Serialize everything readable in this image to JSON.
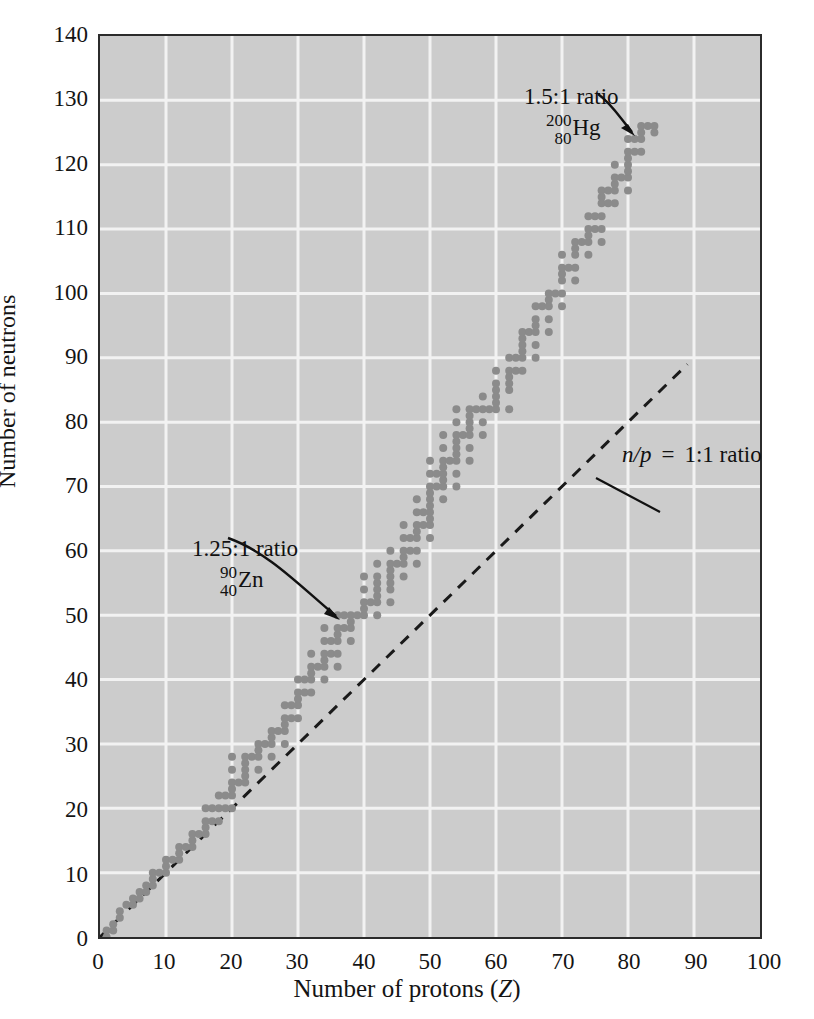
{
  "figure": {
    "kind": "band-of-stability-scatter"
  },
  "axes": {
    "x": {
      "title_main": "Number of protons (",
      "title_symbol": "Z",
      "title_close": ")",
      "ticks": [
        "0",
        "10",
        "20",
        "30",
        "40",
        "50",
        "60",
        "70",
        "80",
        "90",
        "100"
      ]
    },
    "y": {
      "title": "Number of neutrons",
      "ticks": [
        "0",
        "10",
        "20",
        "30",
        "40",
        "50",
        "60",
        "70",
        "80",
        "90",
        "100",
        "110",
        "120",
        "130",
        "140"
      ]
    }
  },
  "annotations": {
    "hg": {
      "ratio": "1.5:1 ratio",
      "mass_number": "200",
      "atomic_number": "80",
      "symbol": "Hg"
    },
    "zn": {
      "ratio": "1.25:1 ratio",
      "mass_number": "90",
      "atomic_number": "40",
      "symbol": "Zn"
    },
    "diagonal": {
      "n_symbol": "n",
      "slash": "/",
      "p_symbol": "p",
      "equals": "=",
      "ratio": "1:1 ratio"
    }
  },
  "colors": {
    "plot_background": "#cccccc",
    "gridline": "#f2f2f2",
    "frame": "#2b2b2b",
    "data_point": "#8b8b8b",
    "dashed_line": "#1a1a1a",
    "text": "#141414"
  },
  "chart_data": {
    "type": "scatter",
    "title": "",
    "xlabel": "Number of protons (Z)",
    "ylabel": "Number of neutrons",
    "xlim": [
      0,
      100
    ],
    "ylim": [
      0,
      140
    ],
    "xticks": [
      0,
      10,
      20,
      30,
      40,
      50,
      60,
      70,
      80,
      90,
      100
    ],
    "yticks": [
      0,
      10,
      20,
      30,
      40,
      50,
      60,
      70,
      80,
      90,
      100,
      110,
      120,
      130,
      140
    ],
    "grid": true,
    "legend": false,
    "marker": {
      "shape": "circle",
      "size_px": 8,
      "color": "#8b8b8b"
    },
    "reference_line": {
      "name": "n/p = 1:1 ratio",
      "style": "dashed",
      "x": [
        0,
        89
      ],
      "y": [
        0,
        89
      ]
    },
    "annotated_points": [
      {
        "label": "200/80 Hg",
        "x": 80,
        "y": 120,
        "ratio": "1.5:1"
      },
      {
        "label": "90/40 Zn",
        "x": 40,
        "y": 50,
        "ratio": "1.25:1"
      }
    ],
    "series": [
      {
        "name": "stable nuclides",
        "points": [
          [
            1,
            0
          ],
          [
            1,
            1
          ],
          [
            2,
            1
          ],
          [
            2,
            2
          ],
          [
            3,
            3
          ],
          [
            3,
            4
          ],
          [
            4,
            5
          ],
          [
            5,
            5
          ],
          [
            5,
            6
          ],
          [
            6,
            6
          ],
          [
            6,
            7
          ],
          [
            7,
            7
          ],
          [
            7,
            8
          ],
          [
            8,
            8
          ],
          [
            8,
            9
          ],
          [
            8,
            10
          ],
          [
            9,
            10
          ],
          [
            10,
            10
          ],
          [
            10,
            11
          ],
          [
            10,
            12
          ],
          [
            11,
            12
          ],
          [
            12,
            12
          ],
          [
            12,
            13
          ],
          [
            12,
            14
          ],
          [
            13,
            14
          ],
          [
            14,
            14
          ],
          [
            14,
            15
          ],
          [
            14,
            16
          ],
          [
            15,
            16
          ],
          [
            16,
            16
          ],
          [
            16,
            17
          ],
          [
            16,
            18
          ],
          [
            16,
            20
          ],
          [
            17,
            18
          ],
          [
            17,
            20
          ],
          [
            18,
            18
          ],
          [
            18,
            20
          ],
          [
            18,
            22
          ],
          [
            19,
            20
          ],
          [
            19,
            22
          ],
          [
            20,
            20
          ],
          [
            20,
            22
          ],
          [
            20,
            23
          ],
          [
            20,
            24
          ],
          [
            20,
            26
          ],
          [
            20,
            28
          ],
          [
            21,
            24
          ],
          [
            22,
            24
          ],
          [
            22,
            25
          ],
          [
            22,
            26
          ],
          [
            22,
            27
          ],
          [
            22,
            28
          ],
          [
            23,
            28
          ],
          [
            24,
            26
          ],
          [
            24,
            28
          ],
          [
            24,
            29
          ],
          [
            24,
            30
          ],
          [
            25,
            30
          ],
          [
            26,
            28
          ],
          [
            26,
            30
          ],
          [
            26,
            31
          ],
          [
            26,
            32
          ],
          [
            27,
            32
          ],
          [
            28,
            30
          ],
          [
            28,
            32
          ],
          [
            28,
            33
          ],
          [
            28,
            34
          ],
          [
            28,
            36
          ],
          [
            29,
            34
          ],
          [
            29,
            36
          ],
          [
            30,
            34
          ],
          [
            30,
            36
          ],
          [
            30,
            37
          ],
          [
            30,
            38
          ],
          [
            30,
            40
          ],
          [
            31,
            38
          ],
          [
            31,
            40
          ],
          [
            32,
            38
          ],
          [
            32,
            40
          ],
          [
            32,
            41
          ],
          [
            32,
            42
          ],
          [
            32,
            44
          ],
          [
            33,
            42
          ],
          [
            34,
            40
          ],
          [
            34,
            42
          ],
          [
            34,
            43
          ],
          [
            34,
            44
          ],
          [
            34,
            46
          ],
          [
            34,
            48
          ],
          [
            35,
            44
          ],
          [
            35,
            46
          ],
          [
            36,
            42
          ],
          [
            36,
            44
          ],
          [
            36,
            46
          ],
          [
            36,
            47
          ],
          [
            36,
            48
          ],
          [
            36,
            50
          ],
          [
            37,
            48
          ],
          [
            37,
            50
          ],
          [
            38,
            46
          ],
          [
            38,
            48
          ],
          [
            38,
            49
          ],
          [
            38,
            50
          ],
          [
            39,
            50
          ],
          [
            40,
            50
          ],
          [
            40,
            51
          ],
          [
            40,
            52
          ],
          [
            40,
            54
          ],
          [
            40,
            56
          ],
          [
            41,
            52
          ],
          [
            42,
            50
          ],
          [
            42,
            52
          ],
          [
            42,
            53
          ],
          [
            42,
            54
          ],
          [
            42,
            55
          ],
          [
            42,
            56
          ],
          [
            42,
            58
          ],
          [
            44,
            52
          ],
          [
            44,
            54
          ],
          [
            44,
            55
          ],
          [
            44,
            56
          ],
          [
            44,
            57
          ],
          [
            44,
            58
          ],
          [
            44,
            60
          ],
          [
            45,
            58
          ],
          [
            46,
            56
          ],
          [
            46,
            58
          ],
          [
            46,
            59
          ],
          [
            46,
            60
          ],
          [
            46,
            62
          ],
          [
            46,
            64
          ],
          [
            47,
            60
          ],
          [
            47,
            62
          ],
          [
            48,
            58
          ],
          [
            48,
            60
          ],
          [
            48,
            62
          ],
          [
            48,
            63
          ],
          [
            48,
            64
          ],
          [
            48,
            66
          ],
          [
            48,
            68
          ],
          [
            49,
            64
          ],
          [
            49,
            66
          ],
          [
            50,
            62
          ],
          [
            50,
            64
          ],
          [
            50,
            65
          ],
          [
            50,
            66
          ],
          [
            50,
            67
          ],
          [
            50,
            68
          ],
          [
            50,
            69
          ],
          [
            50,
            70
          ],
          [
            50,
            72
          ],
          [
            50,
            74
          ],
          [
            51,
            70
          ],
          [
            51,
            72
          ],
          [
            52,
            68
          ],
          [
            52,
            70
          ],
          [
            52,
            71
          ],
          [
            52,
            72
          ],
          [
            52,
            73
          ],
          [
            52,
            74
          ],
          [
            52,
            76
          ],
          [
            52,
            78
          ],
          [
            53,
            74
          ],
          [
            54,
            70
          ],
          [
            54,
            72
          ],
          [
            54,
            74
          ],
          [
            54,
            75
          ],
          [
            54,
            76
          ],
          [
            54,
            77
          ],
          [
            54,
            78
          ],
          [
            54,
            80
          ],
          [
            54,
            82
          ],
          [
            55,
            78
          ],
          [
            56,
            74
          ],
          [
            56,
            76
          ],
          [
            56,
            78
          ],
          [
            56,
            79
          ],
          [
            56,
            80
          ],
          [
            56,
            81
          ],
          [
            56,
            82
          ],
          [
            57,
            82
          ],
          [
            58,
            78
          ],
          [
            58,
            80
          ],
          [
            58,
            82
          ],
          [
            58,
            84
          ],
          [
            59,
            82
          ],
          [
            60,
            82
          ],
          [
            60,
            83
          ],
          [
            60,
            84
          ],
          [
            60,
            85
          ],
          [
            60,
            86
          ],
          [
            60,
            88
          ],
          [
            62,
            82
          ],
          [
            62,
            85
          ],
          [
            62,
            86
          ],
          [
            62,
            87
          ],
          [
            62,
            88
          ],
          [
            62,
            90
          ],
          [
            63,
            88
          ],
          [
            63,
            90
          ],
          [
            64,
            88
          ],
          [
            64,
            90
          ],
          [
            64,
            91
          ],
          [
            64,
            92
          ],
          [
            64,
            93
          ],
          [
            64,
            94
          ],
          [
            65,
            94
          ],
          [
            66,
            90
          ],
          [
            66,
            92
          ],
          [
            66,
            94
          ],
          [
            66,
            95
          ],
          [
            66,
            96
          ],
          [
            66,
            98
          ],
          [
            67,
            98
          ],
          [
            68,
            94
          ],
          [
            68,
            96
          ],
          [
            68,
            98
          ],
          [
            68,
            99
          ],
          [
            68,
            100
          ],
          [
            69,
            100
          ],
          [
            70,
            98
          ],
          [
            70,
            100
          ],
          [
            70,
            102
          ],
          [
            70,
            103
          ],
          [
            70,
            104
          ],
          [
            70,
            106
          ],
          [
            71,
            104
          ],
          [
            72,
            102
          ],
          [
            72,
            104
          ],
          [
            72,
            106
          ],
          [
            72,
            107
          ],
          [
            72,
            108
          ],
          [
            73,
            108
          ],
          [
            74,
            106
          ],
          [
            74,
            108
          ],
          [
            74,
            109
          ],
          [
            74,
            110
          ],
          [
            74,
            112
          ],
          [
            75,
            110
          ],
          [
            75,
            112
          ],
          [
            76,
            108
          ],
          [
            76,
            110
          ],
          [
            76,
            112
          ],
          [
            76,
            114
          ],
          [
            76,
            115
          ],
          [
            76,
            116
          ],
          [
            77,
            114
          ],
          [
            77,
            116
          ],
          [
            78,
            114
          ],
          [
            78,
            116
          ],
          [
            78,
            117
          ],
          [
            78,
            118
          ],
          [
            78,
            120
          ],
          [
            79,
            118
          ],
          [
            80,
            116
          ],
          [
            80,
            118
          ],
          [
            80,
            119
          ],
          [
            80,
            120
          ],
          [
            80,
            121
          ],
          [
            80,
            122
          ],
          [
            80,
            124
          ],
          [
            81,
            122
          ],
          [
            81,
            124
          ],
          [
            82,
            122
          ],
          [
            82,
            124
          ],
          [
            82,
            125
          ],
          [
            82,
            126
          ],
          [
            83,
            126
          ],
          [
            84,
            125
          ],
          [
            84,
            126
          ]
        ]
      }
    ]
  }
}
